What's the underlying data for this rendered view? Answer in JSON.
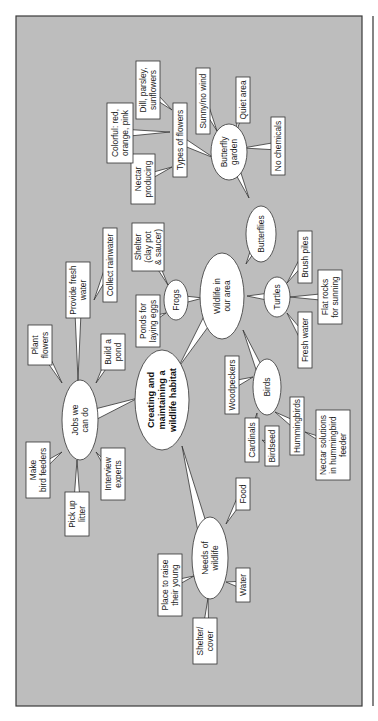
{
  "diagram": {
    "orientation": "rotated-90-ccw",
    "central": {
      "id": "center",
      "lines": [
        "Creating and",
        "maintaining a",
        "wildlife habitat"
      ]
    },
    "ellipses": [
      {
        "id": "jobs",
        "lines": [
          "Jobs we",
          "can do"
        ]
      },
      {
        "id": "wildlife",
        "lines": [
          "Wildlife in",
          "our area"
        ]
      },
      {
        "id": "needs",
        "lines": [
          "Needs of",
          "wildlife"
        ]
      },
      {
        "id": "frogs",
        "lines": [
          "Frogs"
        ]
      },
      {
        "id": "butterflies",
        "lines": [
          "Butterflies"
        ]
      },
      {
        "id": "butterfly_garden",
        "lines": [
          "Butterfly",
          "garden"
        ]
      },
      {
        "id": "turtles",
        "lines": [
          "Turtles"
        ]
      },
      {
        "id": "birds",
        "lines": [
          "Birds"
        ]
      }
    ],
    "boxes": [
      {
        "id": "make_feeders",
        "parent": "jobs",
        "lines": [
          "Make",
          "bird feeders"
        ]
      },
      {
        "id": "pick_litter",
        "parent": "jobs",
        "lines": [
          "Pick up",
          "litter"
        ]
      },
      {
        "id": "interview",
        "parent": "jobs",
        "lines": [
          "Interview",
          "experts"
        ]
      },
      {
        "id": "plant_flowers",
        "parent": "jobs",
        "lines": [
          "Plant",
          "flowers"
        ]
      },
      {
        "id": "fresh_water_job",
        "parent": "jobs",
        "lines": [
          "Provide fresh",
          "water"
        ]
      },
      {
        "id": "build_pond",
        "parent": "jobs",
        "lines": [
          "Build a",
          "pond"
        ]
      },
      {
        "id": "rainwater",
        "parent": "fresh_water_job",
        "lines": [
          "Collect rainwater"
        ]
      },
      {
        "id": "ponds_eggs",
        "parent": "frogs",
        "lines": [
          "Ponds for",
          "laying eggs"
        ]
      },
      {
        "id": "shelter_pot",
        "parent": "frogs",
        "lines": [
          "Shelter",
          "(clay pot",
          "& saucer)"
        ]
      },
      {
        "id": "types_flowers",
        "parent": "butterfly_garden",
        "lines": [
          "Types of flowers"
        ]
      },
      {
        "id": "nectar",
        "parent": "types_flowers",
        "lines": [
          "Nectar",
          "producing"
        ]
      },
      {
        "id": "colorful",
        "parent": "types_flowers",
        "lines": [
          "Colorful: red,",
          "orange, pink"
        ]
      },
      {
        "id": "dill",
        "parent": "types_flowers",
        "lines": [
          "Dill, parsley,",
          "sunflowers"
        ]
      },
      {
        "id": "sunny",
        "parent": "butterfly_garden",
        "lines": [
          "Sunny/no wind"
        ]
      },
      {
        "id": "quiet",
        "parent": "butterfly_garden",
        "lines": [
          "Quiet area"
        ]
      },
      {
        "id": "no_chem",
        "parent": "butterfly_garden",
        "lines": [
          "No chemicals"
        ]
      },
      {
        "id": "brush",
        "parent": "turtles",
        "lines": [
          "Brush piles"
        ]
      },
      {
        "id": "flat_rocks",
        "parent": "turtles",
        "lines": [
          "Flat rocks",
          "for sunning"
        ]
      },
      {
        "id": "fresh_water_turtle",
        "parent": "turtles",
        "lines": [
          "Fresh water"
        ]
      },
      {
        "id": "woodpeckers",
        "parent": "birds",
        "lines": [
          "Woodpeckers"
        ]
      },
      {
        "id": "cardinals",
        "parent": "birds",
        "lines": [
          "Cardinals"
        ]
      },
      {
        "id": "birdseed",
        "parent": "cardinals",
        "lines": [
          "Birdseed"
        ]
      },
      {
        "id": "hummingbirds",
        "parent": "birds",
        "lines": [
          "Hummingbirds"
        ]
      },
      {
        "id": "nectar_solutions",
        "parent": "hummingbirds",
        "lines": [
          "Nectar solutions",
          "in hummingbird",
          "feeder"
        ]
      },
      {
        "id": "food",
        "parent": "needs",
        "lines": [
          "Food"
        ]
      },
      {
        "id": "water",
        "parent": "needs",
        "lines": [
          "Water"
        ]
      },
      {
        "id": "raise_young",
        "parent": "needs",
        "lines": [
          "Place to raise",
          "their young"
        ]
      },
      {
        "id": "shelter_cover",
        "parent": "needs",
        "lines": [
          "Shelter/",
          "cover"
        ]
      }
    ],
    "colors": {
      "panel": "#bdbdbd",
      "node_fill": "#ffffff",
      "stroke": "#333333"
    }
  }
}
